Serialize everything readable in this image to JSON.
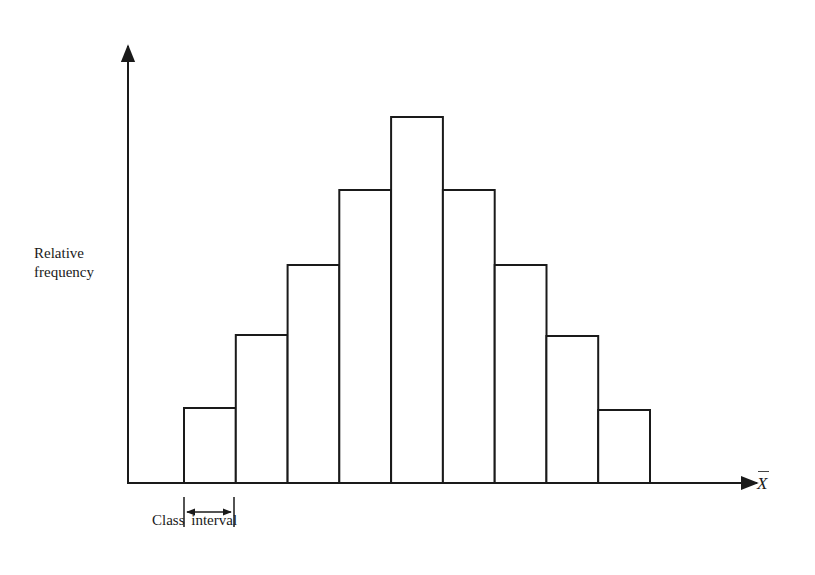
{
  "chart_data": {
    "type": "bar",
    "subtype": "histogram",
    "title": "",
    "xlabel": "X̄",
    "ylabel": "Relative frequency",
    "annotation": "Class interval",
    "annotation_target": "width of first bar",
    "categories": [
      "1",
      "2",
      "3",
      "4",
      "5",
      "6",
      "7",
      "8",
      "9"
    ],
    "values": [
      75,
      148,
      218,
      293,
      366,
      293,
      218,
      147,
      73
    ],
    "values_note": "Relative bar heights measured in pixels from the baseline; the figure has no numeric axis scale.",
    "normalized_interpretation": [
      1,
      2,
      3,
      4,
      5,
      4,
      3,
      2,
      1
    ],
    "normalized_note": "Approximate pattern after scaling to the tallest bar; inferred from the bar shape, not from labeled values.",
    "ylim": [
      0,
      400
    ],
    "grid": false,
    "legend": null,
    "tick_labels": false
  },
  "labels": {
    "ylabel_line1": "Relative",
    "ylabel_line2": "frequency",
    "xlabel": "X",
    "class_interval": "Class interval"
  },
  "colors": {
    "stroke": "#1a1a1a",
    "fill": "#ffffff",
    "background": "#ffffff"
  }
}
